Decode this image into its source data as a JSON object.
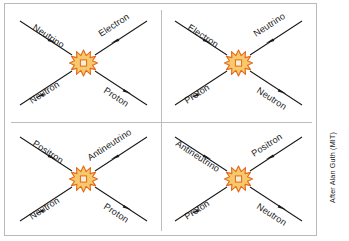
{
  "figure": {
    "credit": "After Alan Guth (MIT)",
    "colors": {
      "line": "#1a1a1a",
      "text": "#1a1a1a",
      "border": "#b9b9b9",
      "divider": "#bcbcbc",
      "background": "#ffffff",
      "star_outline": "#e2691a",
      "star_fill": "#f7c96b",
      "star_core_fill": "#f6ead0",
      "star_core_outline": "#e2691a"
    }
  },
  "panels": [
    {
      "id": "panel-top-left",
      "vertex_icon": "interaction-starburst-icon",
      "particles": [
        {
          "slot": "top-left",
          "label": "Neutrino",
          "direction": "incoming"
        },
        {
          "slot": "top-right",
          "label": "Electron",
          "direction": "outgoing"
        },
        {
          "slot": "bottom-left",
          "label": "Neutron",
          "direction": "incoming"
        },
        {
          "slot": "bottom-right",
          "label": "Proton",
          "direction": "outgoing"
        }
      ]
    },
    {
      "id": "panel-top-right",
      "vertex_icon": "interaction-starburst-icon",
      "particles": [
        {
          "slot": "top-left",
          "label": "Electron",
          "direction": "incoming"
        },
        {
          "slot": "top-right",
          "label": "Neutrino",
          "direction": "outgoing"
        },
        {
          "slot": "bottom-left",
          "label": "Proton",
          "direction": "incoming"
        },
        {
          "slot": "bottom-right",
          "label": "Neutron",
          "direction": "outgoing"
        }
      ]
    },
    {
      "id": "panel-bottom-left",
      "vertex_icon": "interaction-starburst-icon",
      "particles": [
        {
          "slot": "top-left",
          "label": "Positron",
          "direction": "incoming"
        },
        {
          "slot": "top-right",
          "label": "Antineutrino",
          "direction": "outgoing"
        },
        {
          "slot": "bottom-left",
          "label": "Neutron",
          "direction": "incoming"
        },
        {
          "slot": "bottom-right",
          "label": "Proton",
          "direction": "outgoing"
        }
      ]
    },
    {
      "id": "panel-bottom-right",
      "vertex_icon": "interaction-starburst-icon",
      "particles": [
        {
          "slot": "top-left",
          "label": "Antineutrino",
          "direction": "incoming"
        },
        {
          "slot": "top-right",
          "label": "Positron",
          "direction": "outgoing"
        },
        {
          "slot": "bottom-left",
          "label": "Proton",
          "direction": "incoming"
        },
        {
          "slot": "bottom-right",
          "label": "Neutron",
          "direction": "outgoing"
        }
      ]
    }
  ]
}
